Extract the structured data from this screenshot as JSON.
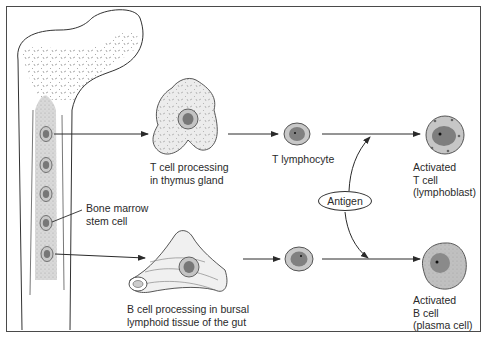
{
  "diagram": {
    "type": "lymphocyte development flow",
    "labels": {
      "bone_marrow": "Bone marrow\nstem cell",
      "t_processing": "T cell processing\nin thymus gland",
      "t_lymphocyte": "T lymphocyte",
      "activated_t": "Activated\nT cell\n(lymphoblast)",
      "antigen": "Antigen",
      "b_processing": "B cell processing in bursal\nlymphoid tissue of the gut",
      "activated_b": "Activated\nB cell\n(plasma cell)"
    },
    "nodes": [
      {
        "id": "bone-marrow",
        "label": "Bone marrow stem cell"
      },
      {
        "id": "thymus",
        "label": "T cell processing in thymus gland"
      },
      {
        "id": "t-lymphocyte",
        "label": "T lymphocyte"
      },
      {
        "id": "activated-t-cell",
        "label": "Activated T cell (lymphoblast)"
      },
      {
        "id": "bursal-tissue",
        "label": "B cell processing in bursal lymphoid tissue of the gut"
      },
      {
        "id": "b-lymphocyte",
        "label": ""
      },
      {
        "id": "activated-b-cell",
        "label": "Activated B cell (plasma cell)"
      },
      {
        "id": "antigen",
        "label": "Antigen"
      }
    ],
    "edges": [
      {
        "from": "bone-marrow",
        "to": "thymus"
      },
      {
        "from": "thymus",
        "to": "t-lymphocyte"
      },
      {
        "from": "t-lymphocyte",
        "to": "activated-t-cell"
      },
      {
        "from": "bone-marrow",
        "to": "bursal-tissue"
      },
      {
        "from": "bursal-tissue",
        "to": "b-lymphocyte"
      },
      {
        "from": "b-lymphocyte",
        "to": "activated-b-cell"
      },
      {
        "from": "antigen",
        "to": "t-lymphocyte->activated-t-cell"
      },
      {
        "from": "antigen",
        "to": "b-lymphocyte->activated-b-cell"
      }
    ],
    "colors": {
      "line": "#2a2a2a",
      "cell_outer": "#bdbdbd",
      "cell_nucleus": "#7a7a7a",
      "marrow": "#d6d6d6",
      "tissue": "#e6e6e6"
    }
  }
}
